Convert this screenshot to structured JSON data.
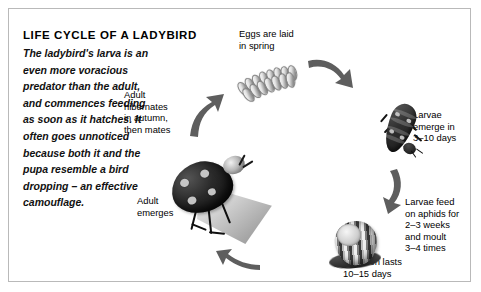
{
  "diagram": {
    "title": "LIFE CYCLE OF A LADYBIRD",
    "intro": "The ladybird's larva is an even more voracious predator than the adult, and commences feeding as soon as it hatches. It often goes unnoticed because both it and the pupa resemble a bird dropping – an effective camouflage.",
    "border_color": "#b9b9b9",
    "background_color": "#ffffff",
    "text_color": "#000000",
    "arrow_color": "#595959",
    "stages": [
      {
        "id": "eggs",
        "label": "Eggs are laid\nin spring",
        "image_name": "ladybird-eggs-photo"
      },
      {
        "id": "larvae-emerge",
        "label": "Larvae\nemerge in\n3–10 days",
        "image_name": "ladybird-larva-photo"
      },
      {
        "id": "larvae-feed",
        "label": "Larvae feed\non aphids for\n2–3 weeks\nand moult\n3–4 times",
        "image_name": ""
      },
      {
        "id": "pupation",
        "label": "Pupation lasts\n10–15 days",
        "image_name": "ladybird-pupa-photo"
      },
      {
        "id": "adult-emerges",
        "label": "Adult\nemerges",
        "image_name": "adult-ladybird-photo"
      },
      {
        "id": "hibernate",
        "label": "Adult\nhibernates\nin autumn,\nthen mates",
        "image_name": ""
      }
    ],
    "arrows": [
      {
        "id": "arrow-up",
        "direction": "up-right"
      },
      {
        "id": "arrow-eggs-larva",
        "direction": "curve-down-right"
      },
      {
        "id": "arrow-larva-pupa",
        "direction": "curve-down-left"
      },
      {
        "id": "arrow-pupa-adult",
        "direction": "left"
      }
    ]
  }
}
